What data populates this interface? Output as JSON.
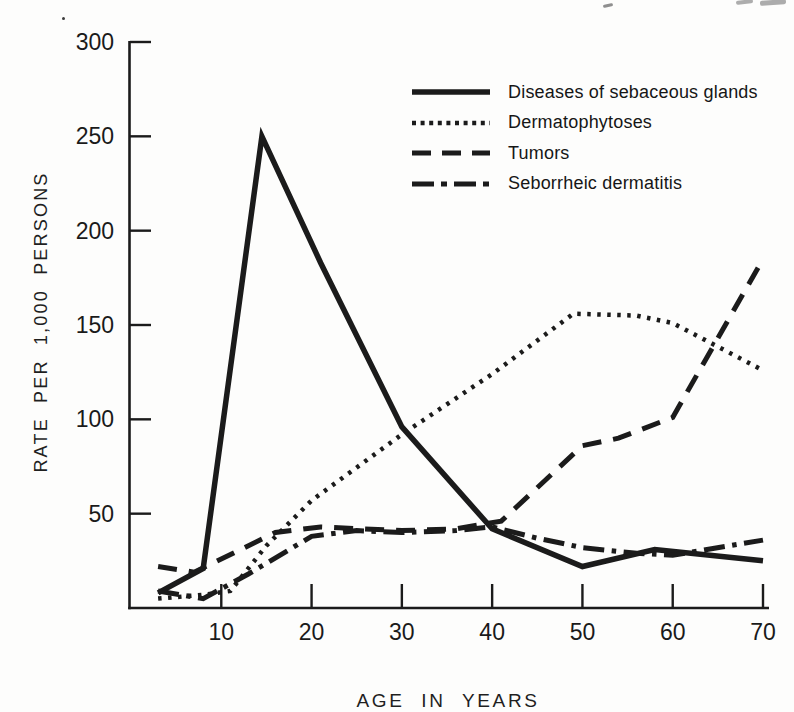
{
  "page": {
    "background": "#fdfdfc",
    "ink": "#1b1b1b",
    "artifacts": [
      "tiny-speck-upper-left",
      "faint-dash-top-center",
      "cropped-print-marks-top-right"
    ]
  },
  "chart_data": {
    "type": "line",
    "title": "",
    "xlabel": "AGE IN YEARS",
    "ylabel": "RATE PER 1,000 PERSONS",
    "xlim": [
      0,
      70
    ],
    "ylim": [
      0,
      300
    ],
    "x_ticks": [
      10,
      20,
      30,
      40,
      50,
      60,
      70
    ],
    "y_ticks": [
      50,
      100,
      150,
      200,
      250,
      300
    ],
    "grid": false,
    "legend_position": "inside-top-right",
    "series": [
      {
        "name": "Diseases of sebaceous glands",
        "line_style": "solid",
        "points": [
          [
            3,
            8
          ],
          [
            8,
            21
          ],
          [
            14.5,
            250
          ],
          [
            21,
            183
          ],
          [
            30,
            96
          ],
          [
            40,
            42
          ],
          [
            50,
            22
          ],
          [
            58,
            31
          ],
          [
            70,
            25
          ]
        ]
      },
      {
        "name": "Dermatophytoses",
        "line_style": "dotted",
        "points": [
          [
            3,
            5
          ],
          [
            8,
            7
          ],
          [
            11,
            9
          ],
          [
            15,
            33
          ],
          [
            20,
            57
          ],
          [
            30,
            92
          ],
          [
            40,
            124
          ],
          [
            49,
            156
          ],
          [
            56,
            155
          ],
          [
            60,
            151
          ],
          [
            70,
            126
          ]
        ]
      },
      {
        "name": "Tumors",
        "line_style": "dashed",
        "points": [
          [
            3,
            22
          ],
          [
            7,
            19
          ],
          [
            16,
            40
          ],
          [
            21,
            43
          ],
          [
            30,
            41
          ],
          [
            36,
            42
          ],
          [
            41,
            46
          ],
          [
            50,
            86
          ],
          [
            54,
            90
          ],
          [
            60,
            101
          ],
          [
            70,
            185
          ]
        ]
      },
      {
        "name": "Seborrheic dermatitis",
        "line_style": "dash-dot",
        "points": [
          [
            3,
            9
          ],
          [
            8,
            5
          ],
          [
            13,
            18
          ],
          [
            20,
            38
          ],
          [
            25,
            41
          ],
          [
            30,
            40
          ],
          [
            36,
            41
          ],
          [
            40,
            43
          ],
          [
            45,
            37
          ],
          [
            50,
            32
          ],
          [
            56,
            29
          ],
          [
            60,
            28
          ],
          [
            70,
            36
          ]
        ]
      }
    ]
  }
}
